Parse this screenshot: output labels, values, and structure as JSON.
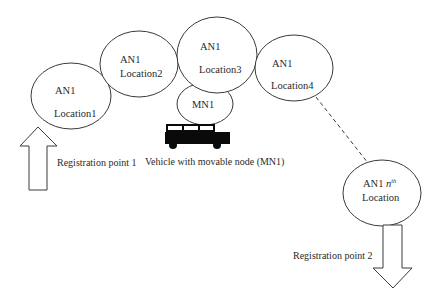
{
  "diagram": {
    "nodes": [
      {
        "id": "loc1",
        "line1": "AN1",
        "line2": "Location1"
      },
      {
        "id": "loc2",
        "line1": "AN1",
        "line2": "Location2"
      },
      {
        "id": "loc3",
        "line1": "AN1",
        "line2": "Location3"
      },
      {
        "id": "loc4",
        "line1": "AN1",
        "line2": "Location4"
      },
      {
        "id": "mn1",
        "line1": "MN1"
      },
      {
        "id": "locn",
        "line1_prefix": "AN1 ",
        "line1_italic": "n",
        "line1_sup": "th",
        "line2": "Location"
      }
    ],
    "labels": {
      "registration_point_1": "Registration point 1",
      "registration_point_2": "Registration point 2",
      "vehicle_caption": "Vehicle with movable node (MN1)"
    },
    "edges": [
      {
        "from": "loc4",
        "to": "locn",
        "style": "dashed"
      }
    ],
    "arrows": [
      {
        "at": "registration_point_1",
        "direction": "up"
      },
      {
        "at": "registration_point_2",
        "direction": "down"
      }
    ],
    "icons": {
      "vehicle": "bus-icon"
    },
    "colors": {
      "stroke": "#3a3a3a",
      "text": "#2a2a2a",
      "vehicle": "#0a0a0a",
      "background": "#ffffff"
    }
  }
}
